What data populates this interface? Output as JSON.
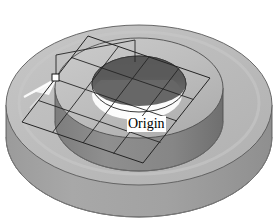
{
  "view": {
    "title": "3D CAD model view",
    "background_color": "#ffffff",
    "width": 279,
    "height": 224
  },
  "labels": {
    "origin": "Origin"
  },
  "palette": {
    "base_top": "#b9b9b9",
    "base_top_light": "#c6c6c6",
    "base_side": "#a0a0a0",
    "base_side_dark": "#949494",
    "boss_top": "#bdbdbd",
    "boss_side": "#8c8c8c",
    "boss_side_dark": "#7e7e7e",
    "bore_wall_dark": "#5e5e5e",
    "bore_floor": "#fdfdfd",
    "outline": "#4a4a4a",
    "sketch_line": "#2b2b2b",
    "highlight_white": "#ffffff",
    "origin_marker_fill": "#ffffff",
    "origin_marker_stroke": "#1a1a1a",
    "label_background": "#ffffff",
    "label_text": "#000000"
  },
  "geometry": {
    "base_disc": {
      "name": "cylindrical base disc",
      "center_x": 139,
      "center_y": 105,
      "radius_x": 133,
      "radius_y": 80,
      "thickness": 38
    },
    "boss": {
      "name": "raised circular boss",
      "center_x": 139,
      "center_y": 88,
      "radius_x": 84,
      "radius_y": 50,
      "height": 33
    },
    "bore": {
      "name": "through hole",
      "center_x": 139,
      "center_y": 84,
      "radius_x": 47,
      "radius_y": 28,
      "depth": 22
    },
    "sketch_plane": {
      "name": "sketch plane parallelogram",
      "corners": [
        {
          "x": 88,
          "y": 36
        },
        {
          "x": 210,
          "y": 78
        },
        {
          "x": 143,
          "y": 163
        },
        {
          "x": 22,
          "y": 122
        }
      ],
      "grid_lines_u": 3,
      "grid_lines_v": 3
    },
    "origin_marker": {
      "name": "origin point marker",
      "x": 55,
      "y": 77,
      "size": 7
    },
    "highlight_arrow": {
      "name": "white highlight arrow",
      "from": {
        "x": 24,
        "y": 96
      },
      "to": {
        "x": 56,
        "y": 77
      }
    }
  },
  "elements": {
    "base_disc_name": "base-disc",
    "boss_name": "raised-boss",
    "bore_name": "through-hole",
    "sketch_plane_name": "sketch-plane",
    "origin_marker_name": "origin-point-marker",
    "origin_label_name": "origin-label"
  }
}
